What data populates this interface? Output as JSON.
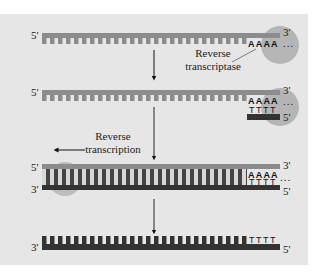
{
  "diagram": {
    "colors": {
      "background": "#e6e6e6",
      "rna_strand": "#8c8c8c",
      "dna_strand": "#333333",
      "enzyme": "#b0b0b0",
      "arrow": "#111111"
    },
    "steps": [
      {
        "id": "step1",
        "labels": {
          "left_end": "5'",
          "right_end": "3'"
        },
        "poly_a": "AAAA",
        "trailing": "...",
        "enzyme_label": "Reverse transcriptase"
      },
      {
        "id": "step2",
        "labels": {
          "left_end": "5'",
          "right_end": "3'",
          "primer_end": "5'"
        },
        "poly_a": "AAAA",
        "oligo_t": "TTTT",
        "trailing": "..."
      },
      {
        "id": "step3",
        "labels": {
          "top_left": "5'",
          "top_right": "3'",
          "bottom_left": "3'",
          "bottom_right": "5'"
        },
        "poly_a": "AAAA",
        "oligo_t": "TTTT",
        "trailing": "...",
        "direction_label": "Reverse transcription"
      },
      {
        "id": "step4",
        "labels": {
          "left_end": "3'",
          "right_end": "5'"
        },
        "oligo_t": "TTTT"
      }
    ],
    "enzyme_label_line1": "Reverse",
    "enzyme_label_line2": "transcriptase",
    "direction_label_line1": "Reverse",
    "direction_label_line2": "transcription"
  }
}
